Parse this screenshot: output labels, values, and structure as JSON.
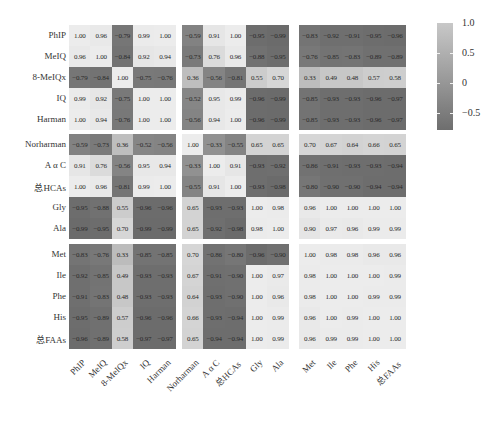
{
  "chart_data": {
    "type": "heatmap",
    "title": "",
    "labels": [
      "PhIP",
      "MeIQ",
      "8-MeIQx",
      "IQ",
      "Harman",
      "Norharman",
      "A α C",
      "总HCAs",
      "Gly",
      "Ala",
      "Met",
      "Ile",
      "Phe",
      "His",
      "总FAAs"
    ],
    "row_groups": [
      5,
      5,
      5
    ],
    "col_groups": [
      5,
      5,
      5
    ],
    "matrix": [
      [
        1.0,
        0.96,
        -0.79,
        0.99,
        1.0,
        -0.59,
        0.91,
        1.0,
        -0.95,
        -0.99,
        -0.83,
        -0.92,
        -0.91,
        -0.95,
        -0.96
      ],
      [
        0.96,
        1.0,
        -0.84,
        0.92,
        0.94,
        -0.73,
        0.76,
        0.96,
        -0.88,
        -0.95,
        -0.76,
        -0.85,
        -0.83,
        -0.89,
        -0.89
      ],
      [
        -0.79,
        -0.84,
        1.0,
        -0.75,
        -0.76,
        0.36,
        -0.56,
        -0.81,
        0.55,
        0.7,
        0.33,
        0.49,
        0.48,
        0.57,
        0.58
      ],
      [
        0.99,
        0.92,
        -0.75,
        1.0,
        1.0,
        -0.52,
        0.95,
        0.99,
        -0.96,
        -0.99,
        -0.85,
        -0.93,
        -0.93,
        -0.96,
        -0.97
      ],
      [
        1.0,
        0.94,
        -0.76,
        1.0,
        1.0,
        -0.56,
        0.94,
        1.0,
        -0.96,
        -0.99,
        -0.85,
        -0.93,
        -0.93,
        -0.96,
        -0.97
      ],
      [
        -0.59,
        -0.73,
        0.36,
        -0.52,
        -0.56,
        1.0,
        -0.33,
        -0.55,
        0.65,
        0.65,
        0.7,
        0.67,
        0.64,
        0.66,
        0.65
      ],
      [
        0.91,
        0.76,
        -0.56,
        0.95,
        0.94,
        -0.33,
        1.0,
        0.91,
        -0.93,
        -0.92,
        -0.86,
        -0.91,
        -0.93,
        -0.93,
        -0.94
      ],
      [
        1.0,
        0.96,
        -0.81,
        0.99,
        1.0,
        -0.55,
        0.91,
        1.0,
        -0.93,
        -0.98,
        -0.8,
        -0.9,
        -0.9,
        -0.94,
        -0.94
      ],
      [
        -0.95,
        -0.88,
        0.55,
        -0.96,
        -0.96,
        0.65,
        -0.93,
        -0.93,
        1.0,
        0.98,
        0.96,
        1.0,
        1.0,
        1.0,
        1.0
      ],
      [
        -0.99,
        -0.95,
        0.7,
        -0.99,
        -0.99,
        0.65,
        -0.92,
        -0.98,
        0.98,
        1.0,
        0.9,
        0.97,
        0.96,
        0.99,
        0.99
      ],
      [
        -0.83,
        -0.76,
        0.33,
        -0.85,
        -0.85,
        0.7,
        -0.86,
        -0.8,
        -0.96,
        -0.9,
        1.0,
        0.98,
        0.98,
        0.96,
        0.96
      ],
      [
        -0.92,
        -0.85,
        0.49,
        -0.93,
        -0.93,
        0.67,
        -0.91,
        -0.9,
        1.0,
        0.97,
        0.98,
        1.0,
        1.0,
        1.0,
        0.99
      ],
      [
        -0.91,
        -0.83,
        0.48,
        -0.93,
        -0.93,
        0.64,
        -0.93,
        -0.9,
        1.0,
        0.96,
        0.98,
        1.0,
        1.0,
        0.99,
        0.99
      ],
      [
        -0.95,
        -0.89,
        0.57,
        -0.96,
        -0.96,
        0.66,
        -0.93,
        -0.94,
        1.0,
        0.99,
        0.96,
        1.0,
        0.99,
        1.0,
        1.0
      ],
      [
        -0.96,
        -0.89,
        0.58,
        -0.97,
        -0.97,
        0.65,
        -0.94,
        -0.94,
        1.0,
        0.99,
        0.96,
        0.99,
        0.99,
        1.0,
        1.0
      ]
    ],
    "colorbar": {
      "ticks": [
        1.0,
        0.5,
        0,
        -0.5
      ],
      "tick_labels": [
        "1.0",
        "0.5",
        "0",
        "−0.5"
      ],
      "range": [
        -1.0,
        1.0
      ],
      "colors": {
        "high": "#e6e6e6",
        "mid": "#9c9c9c",
        "low": "#6e6e6e"
      }
    },
    "xlabel": "",
    "ylabel": "",
    "grid": false,
    "legend_position": "right"
  }
}
